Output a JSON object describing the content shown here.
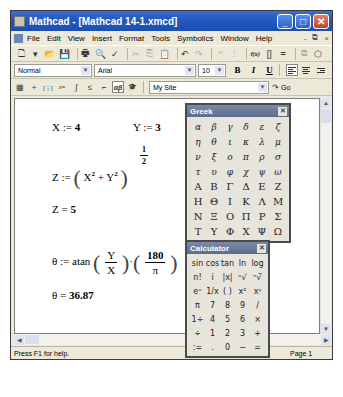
{
  "window": {
    "title": "Mathcad - [Mathcad 14-1.xmcd]",
    "controls": {
      "minimize": "_",
      "maximize": "□",
      "close": "✕"
    }
  },
  "menubar": {
    "items": [
      "File",
      "Edit",
      "View",
      "Insert",
      "Format",
      "Tools",
      "Symbolics",
      "Window",
      "Help"
    ],
    "mdi_controls": [
      "-",
      "⧉",
      "×"
    ]
  },
  "toolbar": {
    "icons": [
      {
        "name": "new-document-icon",
        "glyph": "🗋"
      },
      {
        "name": "dropdown-arrow-icon",
        "glyph": "▾"
      },
      {
        "name": "open-folder-icon",
        "glyph": "📂"
      },
      {
        "name": "save-icon",
        "glyph": "💾"
      },
      {
        "name": "print-icon",
        "glyph": "🖶"
      },
      {
        "name": "print-preview-icon",
        "glyph": "🔍"
      },
      {
        "name": "spell-check-icon",
        "glyph": "✓"
      },
      {
        "name": "cut-icon",
        "glyph": "✂"
      },
      {
        "name": "copy-icon",
        "glyph": "⎘"
      },
      {
        "name": "paste-icon",
        "glyph": "📋"
      },
      {
        "name": "undo-icon",
        "glyph": "↶"
      },
      {
        "name": "redo-icon",
        "glyph": "↷"
      },
      {
        "name": "align-across-icon",
        "glyph": "⁼"
      },
      {
        "name": "align-down-icon",
        "glyph": "⁞"
      },
      {
        "name": "insert-function-icon",
        "glyph": "f(x)"
      },
      {
        "name": "insert-unit-icon",
        "glyph": "[]"
      },
      {
        "name": "calculate-icon",
        "glyph": "="
      },
      {
        "name": "insert-hyperlink-icon",
        "glyph": "⧉"
      },
      {
        "name": "component-wizard-icon",
        "glyph": "⬡"
      }
    ]
  },
  "formatbar": {
    "style_value": "Normal",
    "font_value": "Arial",
    "size_value": "10",
    "bold": "B",
    "italic": "I",
    "underline": "U"
  },
  "mathbar": {
    "icons": [
      {
        "name": "calculator-toolbar-icon",
        "glyph": "▦"
      },
      {
        "name": "graph-toolbar-icon",
        "glyph": "+"
      },
      {
        "name": "matrix-toolbar-icon",
        "glyph": "[⋮]"
      },
      {
        "name": "evaluation-toolbar-icon",
        "glyph": "x="
      },
      {
        "name": "calculus-toolbar-icon",
        "glyph": "∫"
      },
      {
        "name": "boolean-toolbar-icon",
        "glyph": "≤"
      },
      {
        "name": "programming-toolbar-icon",
        "glyph": "⌐"
      },
      {
        "name": "greek-toolbar-icon",
        "glyph": "αβ",
        "pressed": true
      },
      {
        "name": "symbolic-toolbar-icon",
        "glyph": "🎓"
      }
    ],
    "resource_value": "My Site",
    "go_label": "Go"
  },
  "worksheet": {
    "x_def": {
      "lhs": "X :=",
      "value": "4"
    },
    "y_def": {
      "lhs": "Y :=",
      "value": "3"
    },
    "z_def": {
      "lhs": "Z :=",
      "body": "X² + Y²",
      "exp_num": "1",
      "exp_den": "2"
    },
    "z_eval": {
      "lhs": "Z =",
      "value": "5"
    },
    "theta_def": {
      "lhs": "θ :=",
      "func": "atan",
      "frac1_num": "Y",
      "frac1_den": "X",
      "dot": "·",
      "frac2_num": "180",
      "frac2_den": "π"
    },
    "theta_eval": {
      "lhs": "θ =",
      "value": "36.87"
    }
  },
  "greek_palette": {
    "title": "Greek",
    "lower": [
      "α",
      "β",
      "γ",
      "δ",
      "ε",
      "ζ",
      "η",
      "θ",
      "ι",
      "κ",
      "λ",
      "μ",
      "ν",
      "ξ",
      "ο",
      "π",
      "ρ",
      "σ",
      "τ",
      "υ",
      "φ",
      "χ",
      "ψ",
      "ω"
    ],
    "upper": [
      "Α",
      "Β",
      "Γ",
      "Δ",
      "Ε",
      "Ζ",
      "Η",
      "Θ",
      "Ι",
      "Κ",
      "Λ",
      "Μ",
      "Ν",
      "Ξ",
      "Ο",
      "Π",
      "Ρ",
      "Σ",
      "Τ",
      "Υ",
      "Φ",
      "Χ",
      "Ψ",
      "Ω"
    ]
  },
  "calculator_palette": {
    "title": "Calculator",
    "keys": [
      "sin",
      "cos",
      "tan",
      "ln",
      "log",
      "n!",
      "i",
      "|x|",
      "ⁿ√",
      "ⁿ√̄",
      "eˣ",
      "1/x",
      "( )",
      "x²",
      "xʸ",
      "π",
      "7",
      "8",
      "9",
      "/",
      "1÷",
      "4",
      "5",
      "6",
      "×",
      "÷",
      "1",
      "2",
      "3",
      "+",
      ":=",
      ".",
      "0",
      "−",
      "="
    ]
  },
  "statusbar": {
    "help": "Press F1 for help.",
    "mode": "AUTO",
    "page": "Page 1"
  }
}
